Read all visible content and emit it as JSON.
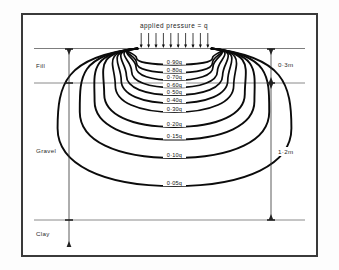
{
  "figure": {
    "title": "applied pressure = q",
    "arrow_count": 10,
    "frame_color": "#3a3a3a",
    "contour_color": "#0b0b0b"
  },
  "soil_layers": [
    {
      "name": "Fill",
      "label": "Fill",
      "thickness_label": "0·3m"
    },
    {
      "name": "Gravel",
      "label": "Gravel",
      "thickness_label": "1·2m"
    },
    {
      "name": "Clay",
      "label": "Clay",
      "thickness_label": ""
    }
  ],
  "dimensions": [
    {
      "id": "fill-depth",
      "label": "0·3m"
    },
    {
      "id": "gravel-depth",
      "label": "1·2m"
    }
  ],
  "chart_data": {
    "type": "line",
    "title": "applied pressure = q",
    "xlabel": "",
    "ylabel": "",
    "legend_position": "none",
    "grid": false,
    "contours": [
      {
        "label": "0·90q",
        "value": 0.9,
        "depth": 0.22,
        "half_width": 0.4
      },
      {
        "label": "0·80q",
        "value": 0.8,
        "depth": 0.33,
        "half_width": 0.46
      },
      {
        "label": "0·70q",
        "value": 0.7,
        "depth": 0.43,
        "half_width": 0.52
      },
      {
        "label": "0·60q",
        "value": 0.6,
        "depth": 0.53,
        "half_width": 0.58
      },
      {
        "label": "0·50q",
        "value": 0.5,
        "depth": 0.63,
        "half_width": 0.65
      },
      {
        "label": "0·40q",
        "value": 0.4,
        "depth": 0.74,
        "half_width": 0.72
      },
      {
        "label": "0·30q",
        "value": 0.3,
        "depth": 0.86,
        "half_width": 0.8
      },
      {
        "label": "0·20q",
        "value": 0.2,
        "depth": 1.06,
        "half_width": 0.95
      },
      {
        "label": "0·15q",
        "value": 0.15,
        "depth": 1.23,
        "half_width": 1.08
      },
      {
        "label": "0·10q",
        "value": 0.1,
        "depth": 1.48,
        "half_width": 1.28
      },
      {
        "label": "0·05q",
        "value": 0.05,
        "depth": 1.86,
        "half_width": 1.58
      }
    ],
    "axis_markers": {
      "ground_surface": "top of Fill",
      "fill_base_depth": "0·3m",
      "gravel_base_depth": "1·2m"
    }
  }
}
